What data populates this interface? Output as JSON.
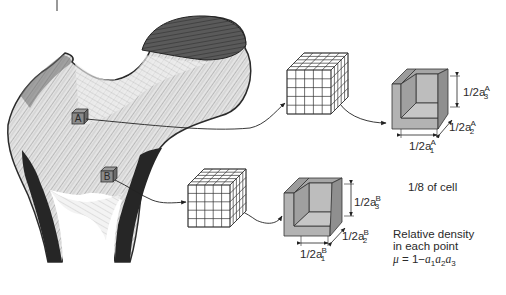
{
  "diagram": {
    "colors": {
      "bone_dark": "#2b2b2b",
      "bone_mid": "#8a8a8a",
      "bone_light": "#d9d9d9",
      "cell_fill": "#b3b3b3",
      "cell_fill_dark": "#8f8f8f",
      "stroke": "#333333",
      "text": "#2a2a2a"
    },
    "markers": [
      {
        "id": "A",
        "label": "A"
      },
      {
        "id": "B",
        "label": "B"
      }
    ],
    "grid_cubes": [
      {
        "id": "A",
        "divisions": 5
      },
      {
        "id": "B",
        "divisions": 5
      }
    ],
    "cell_A": {
      "dim1": {
        "base": "1/2a",
        "sub": "1",
        "sup": "A"
      },
      "dim2": {
        "base": "1/2a",
        "sub": "2",
        "sup": "A"
      },
      "dim3": {
        "base": "1/2a",
        "sub": "3",
        "sup": "A"
      }
    },
    "cell_B": {
      "dim1": {
        "base": "1/2a",
        "sub": "1",
        "sup": "B"
      },
      "dim2": {
        "base": "1/2a",
        "sub": "2",
        "sup": "B"
      },
      "dim3": {
        "base": "1/2a",
        "sub": "3",
        "sup": "B"
      }
    },
    "notes": {
      "fraction": "1/8 of cell",
      "density_line1": "Relative density",
      "density_line2": "in each point",
      "formula_mu": "μ",
      "formula_eq": " = 1−",
      "formula_a": "a",
      "formula_s1": "1",
      "formula_s2": "2",
      "formula_s3": "3"
    }
  }
}
